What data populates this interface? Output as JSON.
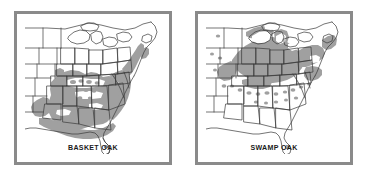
{
  "figure": {
    "type": "species-range-map-pair",
    "background_color": "#ffffff",
    "frame_color": "#8a8a8a",
    "outline_color": "#333333",
    "range_fill_color": "#a0a0a0",
    "label_color": "#1a1a1a"
  },
  "panels": [
    {
      "id": "basket-oak",
      "label": "BASKET OAK",
      "region_description": "Southeastern United States: Gulf Coastal Plain, Lower Mississippi Valley, Atlantic Coastal Plain and Piedmont north to New Jersey",
      "states_covered": [
        "Louisiana",
        "Mississippi",
        "Alabama",
        "Georgia",
        "South Carolina",
        "North Carolina",
        "Virginia",
        "Tennessee",
        "Arkansas",
        "Florida panhandle",
        "Maryland",
        "Delaware",
        "New Jersey",
        "Kentucky",
        "Texas (east)",
        "Missouri (southeast)"
      ],
      "has_outlier_dots": true,
      "outlier_dot_region": "Tennessee / Kentucky interior"
    },
    {
      "id": "swamp-oak",
      "label": "SWAMP OAK",
      "region_description": "Great Lakes region and Ohio Valley: Midwest from Iowa and Minnesota east to New York and New England, south to Kentucky and Missouri",
      "states_covered": [
        "Iowa",
        "Illinois",
        "Indiana",
        "Ohio",
        "Michigan",
        "Wisconsin",
        "Minnesota",
        "Pennsylvania",
        "New York",
        "New Jersey",
        "Maryland",
        "West Virginia",
        "Kentucky",
        "Missouri",
        "Massachusetts",
        "Connecticut"
      ],
      "has_outlier_dots": true,
      "outlier_dot_region": "Scattered across Kansas, Missouri, Tennessee, Virginia and the Carolinas"
    }
  ]
}
